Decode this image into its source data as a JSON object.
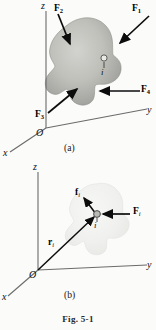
{
  "figure": {
    "number_label": "Fig. 5-1",
    "panels": [
      {
        "caption": "(a)",
        "axes": {
          "x": "x",
          "y": "y",
          "z": "z",
          "origin": "O"
        },
        "particle_label": "i",
        "forces": [
          {
            "name": "F1",
            "bold": "F",
            "sub": "1"
          },
          {
            "name": "F2",
            "bold": "F",
            "sub": "2"
          },
          {
            "name": "F3",
            "bold": "F",
            "sub": "3"
          },
          {
            "name": "F4",
            "bold": "F",
            "sub": "4"
          }
        ],
        "body_fill_dark": "#9a9a98",
        "body_fill_light": "#cfcfcb"
      },
      {
        "caption": "(b)",
        "axes": {
          "x": "x",
          "y": "y",
          "z": "z",
          "origin": "O"
        },
        "particle_label": "i",
        "vectors": [
          {
            "name": "f_i",
            "bold": "f",
            "sub": "i"
          },
          {
            "name": "F_i",
            "bold": "F",
            "sub": "i"
          },
          {
            "name": "r_i",
            "bold": "r",
            "sub": "i"
          }
        ],
        "body_fill_dark": "#ebebe9",
        "body_fill_light": "#f4f4f2"
      }
    ],
    "colors": {
      "axis_line": "#6b6b6b",
      "arrow": "#0c0c0c",
      "ink": "#141414"
    }
  }
}
